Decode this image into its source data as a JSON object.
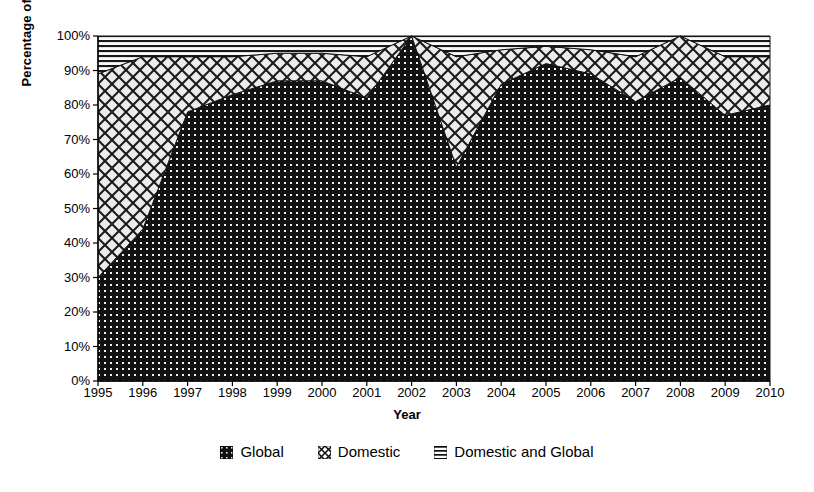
{
  "chart_data": {
    "type": "area",
    "title": "",
    "subtitle": "",
    "xlabel": "Year",
    "ylabel": "Percentage of Actions",
    "stacked": true,
    "stack_total": 100,
    "grid": false,
    "legend_position": "bottom",
    "xlim": [
      1995,
      2010
    ],
    "ylim": [
      0,
      100
    ],
    "x": [
      1995,
      1996,
      1997,
      1998,
      1999,
      2000,
      2001,
      2002,
      2003,
      2004,
      2005,
      2006,
      2007,
      2008,
      2009,
      2010
    ],
    "categories": [
      "1995",
      "1996",
      "1997",
      "1998",
      "1999",
      "2000",
      "2001",
      "2002",
      "2003",
      "2004",
      "2005",
      "2006",
      "2007",
      "2008",
      "2009",
      "2010"
    ],
    "xtick_labels": [
      "1995",
      "1996",
      "1997",
      "1998",
      "1999",
      "2000",
      "2001",
      "2002",
      "2003",
      "2004",
      "2005",
      "2006",
      "2007",
      "2008",
      "2009",
      "2010"
    ],
    "ytick_labels": [
      "0%",
      "10%",
      "20%",
      "30%",
      "40%",
      "50%",
      "60%",
      "70%",
      "80%",
      "90%",
      "100%"
    ],
    "ytick_values": [
      0,
      10,
      20,
      30,
      40,
      50,
      60,
      70,
      80,
      90,
      100
    ],
    "series": [
      {
        "name": "Global",
        "pattern": "dotted-dark",
        "color": "#141414",
        "values": [
          30,
          44,
          78,
          83,
          87,
          87,
          82,
          100,
          62,
          86,
          92,
          89,
          81,
          88,
          77,
          80
        ]
      },
      {
        "name": "Domestic",
        "pattern": "diagonal-crosshatch",
        "color": "#ededed",
        "values": [
          59,
          50,
          16,
          11,
          8,
          8,
          12,
          0,
          32,
          10,
          5,
          7,
          13,
          12,
          17,
          14
        ]
      },
      {
        "name": "Domestic and Global",
        "pattern": "horizontal-lines",
        "color": "#f5f5f5",
        "values": [
          11,
          6,
          6,
          6,
          5,
          5,
          6,
          0,
          6,
          4,
          3,
          4,
          6,
          0,
          6,
          6
        ]
      }
    ],
    "cumulative": {
      "global_top": [
        30,
        44,
        78,
        83,
        87,
        87,
        82,
        100,
        62,
        86,
        92,
        89,
        81,
        88,
        77,
        80
      ],
      "domestic_top": [
        89,
        94,
        94,
        94,
        95,
        95,
        94,
        100,
        94,
        96,
        97,
        96,
        94,
        100,
        94,
        94
      ],
      "total_top": [
        100,
        100,
        100,
        100,
        100,
        100,
        100,
        100,
        100,
        100,
        100,
        100,
        100,
        100,
        100,
        100
      ]
    }
  },
  "legend": {
    "entries": [
      {
        "label": "Global"
      },
      {
        "label": "Domestic"
      },
      {
        "label": "Domestic and Global"
      }
    ]
  }
}
